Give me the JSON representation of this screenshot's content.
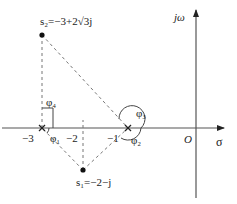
{
  "diagram": {
    "type": "s-plane pole-zero angle diagram",
    "axes": {
      "real_axis_label": "σ",
      "imag_axis_label": "jω",
      "origin_label": "O"
    },
    "tick_labels": {
      "minus3": "−3",
      "minus2": "−2",
      "minus1": "−1"
    },
    "points": {
      "s1": {
        "label": "s₁=−2−j",
        "name": "s1",
        "value": "−2−j"
      },
      "s2": {
        "label": "s₂=−3+2√3j",
        "name": "s2",
        "value": "−3+2√3j"
      }
    },
    "poles": [
      {
        "at": "−3",
        "marker": "×"
      },
      {
        "at": "−1",
        "marker": "×"
      }
    ],
    "angles": {
      "phi1": "φ₁",
      "phi2": "φ₂",
      "phi3": "φ₃",
      "phi4": "φ₄"
    },
    "colors": {
      "axis": "#555555",
      "dashed": "#777777",
      "point": "#111111"
    }
  }
}
